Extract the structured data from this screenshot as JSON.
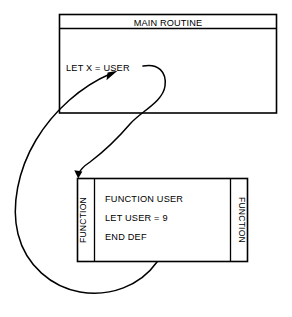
{
  "diagram": {
    "type": "flow-diagram",
    "title_visible": false,
    "background_color": "#ffffff",
    "line_color": "#000000",
    "main_routine_box": {
      "header_label": "MAIN ROUTINE",
      "body_lines": [
        "LET X = USER"
      ]
    },
    "function_box": {
      "left_side_label": "FUNCTION",
      "right_side_label": "FUNCTION",
      "body_lines": [
        "FUNCTION USER",
        "LET USER = 9",
        "END DEF"
      ]
    },
    "connectors": [
      {
        "name": "call-arrow",
        "from": "LET X = USER",
        "to": "FUNCTION USER",
        "direction": "down",
        "arrowhead": "at-function-box-top-left"
      },
      {
        "name": "return-arrow",
        "from": "END DEF",
        "to": "LET X = USER",
        "direction": "up",
        "arrowhead": "at-user-in-main-routine"
      }
    ]
  }
}
